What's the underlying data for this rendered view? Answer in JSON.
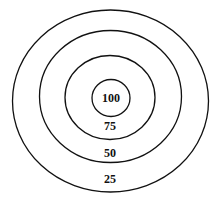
{
  "diagram": {
    "type": "concentric-target",
    "rings": [
      {
        "label": "25"
      },
      {
        "label": "50"
      },
      {
        "label": "75"
      },
      {
        "label": "100"
      }
    ]
  }
}
